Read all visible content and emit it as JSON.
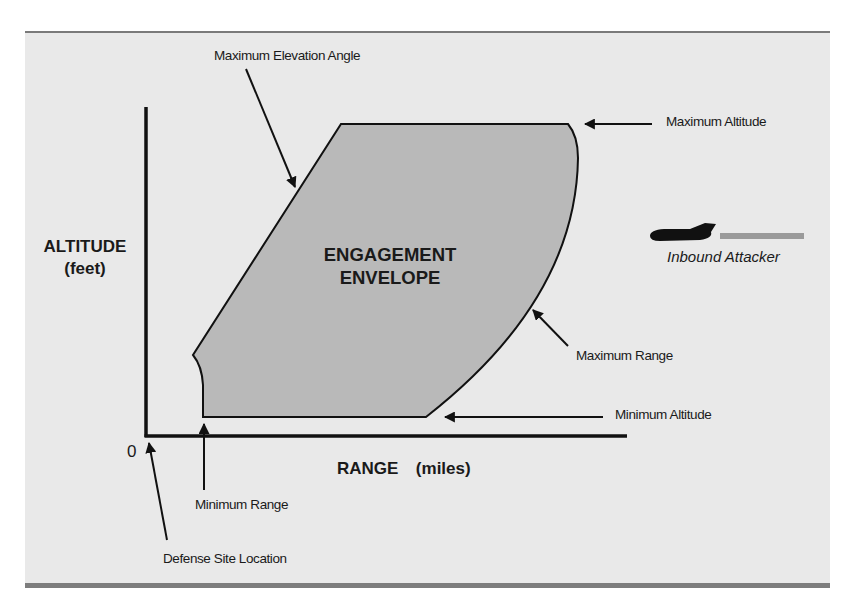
{
  "diagram": {
    "title": "Engagement Envelope",
    "envelope_label_line1": "ENGAGEMENT",
    "envelope_label_line2": "ENVELOPE",
    "y_axis": {
      "label": "ALTITUDE",
      "unit": "(feet)"
    },
    "x_axis": {
      "label": "RANGE",
      "unit": "(miles)",
      "origin": "0"
    },
    "annotations": {
      "max_elevation_angle": "Maximum Elevation Angle",
      "max_altitude": "Maximum Altitude",
      "max_range": "Maximum Range",
      "min_altitude": "Minimum Altitude",
      "min_range": "Minimum Range",
      "defense_site": "Defense Site Location"
    },
    "legend": {
      "attacker_label": "Inbound Attacker",
      "icon": "jet-aircraft-icon"
    },
    "colors": {
      "background": "#e9e9e9",
      "envelope_fill": "#b9b9b9",
      "line": "#111111",
      "rule": "#7a7a7a",
      "trail": "#9a9a9a"
    }
  }
}
